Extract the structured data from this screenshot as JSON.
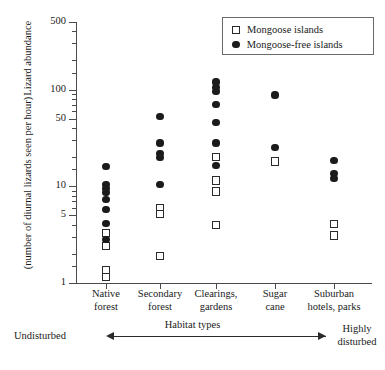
{
  "chart_data": {
    "type": "scatter",
    "title": "",
    "xlabel": "Habitat types",
    "ylabel_line1": "Lizard abundance",
    "ylabel_line2": "(number of diurnal lizards seen per hour)",
    "yscale": "log",
    "ylim": [
      1,
      500
    ],
    "ytick_labels": [
      "500",
      "100",
      "50",
      "10",
      "5",
      "1"
    ],
    "ytick_values": [
      500,
      100,
      50,
      10,
      5,
      1
    ],
    "yminor_values": [
      400,
      300,
      200,
      150,
      90,
      80,
      70,
      60,
      40,
      30,
      20,
      15,
      9,
      8,
      7,
      6,
      4,
      3,
      2,
      1.5
    ],
    "grid": false,
    "categories": [
      "Native\nforest",
      "Secondary\nforest",
      "Clearings,\ngardens",
      "Sugar\ncane",
      "Suburban\nhotels, parks"
    ],
    "categories_flat": [
      "Native forest",
      "Secondary forest",
      "Clearings, gardens",
      "Sugar cane",
      "Suburban hotels, parks"
    ],
    "legend_position": "top-right",
    "series": [
      {
        "name": "Mongoose islands",
        "marker": "open-square",
        "color": "#2a2a2a",
        "points": [
          {
            "category": 0,
            "values": [
              3.3,
              2.4,
              1.35,
              1.15
            ]
          },
          {
            "category": 1,
            "values": [
              6.0,
              5.2,
              1.9
            ]
          },
          {
            "category": 2,
            "values": [
              20.0,
              11.5,
              8.8,
              4.0
            ]
          },
          {
            "category": 3,
            "values": [
              18.0
            ]
          },
          {
            "category": 4,
            "values": [
              4.1,
              3.1
            ]
          }
        ]
      },
      {
        "name": "Mongoose-free islands",
        "marker": "filled-circle",
        "color": "#1b1b1b",
        "points": [
          {
            "category": 0,
            "values": [
              16.0,
              10.5,
              9.5,
              8.6,
              7.3,
              5.7,
              4.1,
              2.8
            ]
          },
          {
            "category": 1,
            "values": [
              53.0,
              28.0,
              22.0,
              20.0,
              10.5
            ]
          },
          {
            "category": 2,
            "values": [
              120.0,
              105.0,
              96.0,
              70.0,
              46.0,
              28.0,
              16.5
            ]
          },
          {
            "category": 3,
            "values": [
              88.0,
              25.0
            ]
          },
          {
            "category": 4,
            "values": [
              18.5,
              13.5,
              12.0
            ]
          }
        ]
      }
    ],
    "annotations": {
      "left_label": "Undisturbed",
      "right_label_line1": "Highly",
      "right_label_line2": "disturbed",
      "axis_caption": "Habitat types",
      "arrow": "double-headed"
    }
  },
  "legend": {
    "items": [
      {
        "label": "Mongoose islands",
        "marker": "open-square"
      },
      {
        "label": "Mongoose-free islands",
        "marker": "filled-circle"
      }
    ]
  }
}
